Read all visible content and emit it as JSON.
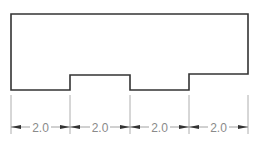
{
  "diagram": {
    "type": "technical-drawing",
    "outline_color": "#333333",
    "dimension_color": "#8a8a8a",
    "profile_points": [
      [
        11,
        14
      ],
      [
        248,
        14
      ],
      [
        248,
        74
      ],
      [
        189,
        74
      ],
      [
        189,
        90
      ],
      [
        130,
        90
      ],
      [
        130,
        75
      ],
      [
        70,
        75
      ],
      [
        70,
        90
      ],
      [
        11,
        90
      ]
    ],
    "extension_lines_x": [
      11,
      70,
      130,
      189,
      248
    ],
    "dimensions": [
      {
        "label": "2.0",
        "x1": 11,
        "x2": 70
      },
      {
        "label": "2.0",
        "x1": 70,
        "x2": 130
      },
      {
        "label": "2.0",
        "x1": 130,
        "x2": 189
      },
      {
        "label": "2.0",
        "x1": 189,
        "x2": 248
      }
    ]
  }
}
